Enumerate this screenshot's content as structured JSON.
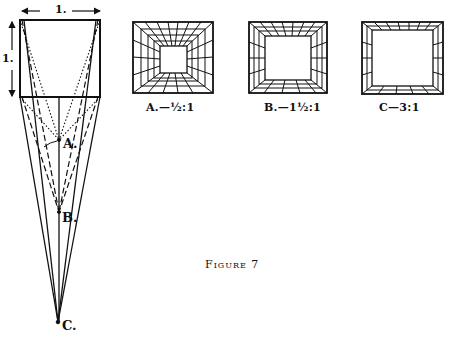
{
  "figure": {
    "title": "Figure 7"
  },
  "left_diagram": {
    "width_label": "1.",
    "height_label": "1.",
    "points": [
      {
        "id": "A",
        "label": "A."
      },
      {
        "id": "B",
        "label": "B."
      },
      {
        "id": "C",
        "label": "C."
      }
    ]
  },
  "rooms": [
    {
      "id": "A",
      "caption": "A.—½:1"
    },
    {
      "id": "B",
      "caption": "B.—1½:1"
    },
    {
      "id": "C",
      "caption": "C—3:1"
    }
  ],
  "colors": {
    "ink": "#111111",
    "paper": "#ffffff"
  }
}
